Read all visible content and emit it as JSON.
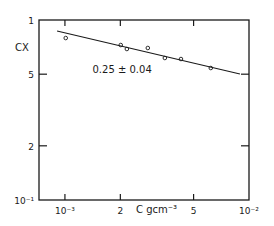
{
  "chart_data": {
    "type": "scatter",
    "title": "",
    "xlabel": "C gcm⁻³",
    "ylabel": "CX",
    "xscale": "log",
    "yscale": "log",
    "xlim": [
      0.000723,
      0.01
    ],
    "ylim": [
      0.1,
      1
    ],
    "grid": false,
    "x_ticks": [
      {
        "value": 0.001,
        "label": "10⁻³"
      },
      {
        "value": 0.002,
        "label": "2"
      },
      {
        "value": 0.005,
        "label": "5"
      },
      {
        "value": 0.01,
        "label": "10⁻²"
      }
    ],
    "y_ticks": [
      {
        "value": 1,
        "label": "1"
      },
      {
        "value": 0.5,
        "label": "5"
      },
      {
        "value": 0.2,
        "label": "2"
      },
      {
        "value": 0.1,
        "label": "10⁻¹"
      }
    ],
    "series": [
      {
        "name": "data",
        "marker": "open-circle",
        "x": [
          0.00101,
          0.00201,
          0.00217,
          0.00282,
          0.00349,
          0.00427,
          0.0062
        ],
        "y": [
          0.794,
          0.726,
          0.69,
          0.699,
          0.615,
          0.607,
          0.541
        ]
      },
      {
        "name": "fit",
        "style": "line",
        "x": [
          0.000906,
          0.00893
        ],
        "y": [
          0.869,
          0.501
        ]
      }
    ],
    "annotations": [
      {
        "text": "0.25 ± 0.04",
        "x": 0.0016,
        "y": 0.5
      }
    ]
  }
}
